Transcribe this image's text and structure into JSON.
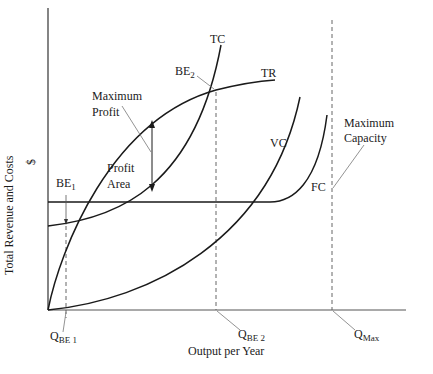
{
  "diagram": {
    "axes": {
      "y_label": "Total Revenue and Costs",
      "y_unit": "$",
      "x_label": "Output per Year"
    },
    "curves": {
      "tc": "TC",
      "tr": "TR",
      "vc": "VC",
      "fc": "FC"
    },
    "points": {
      "be1": {
        "main": "BE",
        "sub": "1"
      },
      "be2": {
        "main": "BE",
        "sub": "2"
      }
    },
    "x_markers": {
      "qbe1": {
        "main": "Q",
        "sub": "BE 1"
      },
      "qbe2": {
        "main": "Q",
        "sub": "BE 2"
      },
      "qmax": {
        "main": "Q",
        "sub": "Max"
      }
    },
    "annotations": {
      "max_profit_line1": "Maximum",
      "max_profit_line2": "Profit",
      "profit_area_line1": "Profit",
      "profit_area_line2": "Area",
      "max_capacity_line1": "Maximum",
      "max_capacity_line2": "Capacity"
    },
    "colors": {
      "line": "#1a1a1a",
      "dashed": "#555555",
      "leader": "#777777"
    }
  }
}
